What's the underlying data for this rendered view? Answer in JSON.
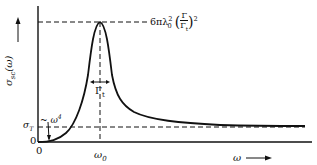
{
  "diagram": {
    "y_axis_label": "σsc(ω) ⟶",
    "y_axis_label_main": "σ",
    "y_axis_label_sub": "sc",
    "y_axis_label_arg": "(ω)",
    "x_axis_label": "ω ⟶",
    "x_axis_label_main": "ω",
    "origin_y_label": "0",
    "origin_x_label": "0",
    "resonance_label": "ω",
    "resonance_sub": "0",
    "width_label": "Γ",
    "width_sub": "t",
    "thomson_label": "σ",
    "thomson_sub": "T",
    "rayleigh_label": "~ ω",
    "rayleigh_sup": "4",
    "peak_label": {
      "prefix": "6πλ",
      "lambda_sup": "2",
      "lambda_sub": "0",
      "frac_num": "Γ",
      "frac_den": "Γ",
      "frac_den_sub": "t",
      "outer_sup": "2"
    },
    "colors": {
      "line": "#111111",
      "background": "#ffffff"
    }
  }
}
